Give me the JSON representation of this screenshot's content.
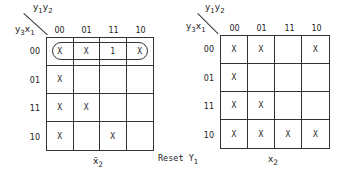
{
  "left_map": {
    "row_var": "y3x1",
    "col_var": "y1y2",
    "col_headers": [
      "00",
      "01",
      "11",
      "10"
    ],
    "row_headers": [
      "00",
      "01",
      "11",
      "10"
    ],
    "cells": [
      [
        "X",
        "X",
        "1",
        "X"
      ],
      [
        "X",
        "",
        "",
        ""
      ],
      [
        "X",
        "X",
        "",
        ""
      ],
      [
        "X",
        "",
        "X",
        ""
      ]
    ],
    "grouping": "row 00 (all four cells looped)",
    "bottom_label": "x̄2"
  },
  "right_map": {
    "row_var": "y3x1",
    "col_var": "y1y2",
    "col_headers": [
      "00",
      "01",
      "11",
      "10"
    ],
    "row_headers": [
      "00",
      "01",
      "11",
      "10"
    ],
    "cells": [
      [
        "X",
        "X",
        "",
        "X"
      ],
      [
        "X",
        "",
        "",
        ""
      ],
      [
        "X",
        "X",
        "",
        ""
      ],
      [
        "X",
        "X",
        "X",
        "X"
      ]
    ],
    "bottom_label": "x2"
  },
  "caption": "Reset Y1",
  "labels": {
    "col_var_main": "y",
    "col_var_sub1": "1",
    "col_var_y2": "y",
    "col_var_sub2": "2",
    "row_var_y": "y",
    "row_var_sub3": "3",
    "row_var_x": "x",
    "row_var_sub1": "1",
    "left_bottom_main": "x̄",
    "left_bottom_sub": "2",
    "right_bottom_main": "x",
    "right_bottom_sub": "2",
    "caption_main": "Reset Y",
    "caption_sub": "1"
  }
}
